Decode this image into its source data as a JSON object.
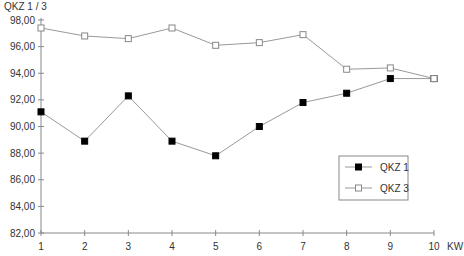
{
  "chart_data": {
    "type": "line",
    "title": "",
    "ylabel": "QKZ 1 / 3",
    "xlabel": "KW",
    "ylim": [
      82,
      98
    ],
    "yticks": [
      "82,00",
      "84,00",
      "86,00",
      "88,00",
      "90,00",
      "92,00",
      "94,00",
      "96,00",
      "98,00"
    ],
    "x": [
      1,
      2,
      3,
      4,
      5,
      6,
      7,
      8,
      9,
      10
    ],
    "series": [
      {
        "name": "QKZ 1",
        "marker": "filled-square",
        "values": [
          91.1,
          88.9,
          92.3,
          88.9,
          87.8,
          90.0,
          91.8,
          92.5,
          93.6,
          93.6
        ]
      },
      {
        "name": "QKZ 3",
        "marker": "open-square",
        "values": [
          97.4,
          96.8,
          96.6,
          97.4,
          96.1,
          96.3,
          96.9,
          94.3,
          94.4,
          93.6
        ]
      }
    ],
    "grid": false,
    "legend_position": "lower-right inside"
  },
  "legend": {
    "items": [
      "QKZ 1",
      "QKZ 3"
    ]
  },
  "colors": {
    "axis": "#888888",
    "line": "#999999",
    "marker_fill": "#000000"
  }
}
